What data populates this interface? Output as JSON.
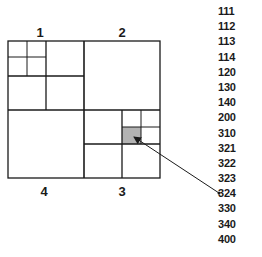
{
  "diagram": {
    "type": "quadtree",
    "quadrant_labels": {
      "q1": "1",
      "q2": "2",
      "q3": "3",
      "q4": "4"
    },
    "highlighted_cell": "323",
    "colors": {
      "line": "#1a1a1a",
      "highlight": "#b3b3b3",
      "background": "#ffffff"
    },
    "arrow": {
      "from": "code-324-row",
      "to": "cell-323"
    }
  },
  "code_list": [
    "111",
    "112",
    "113",
    "114",
    "120",
    "130",
    "140",
    "200",
    "310",
    "321",
    "322",
    "323",
    "324",
    "330",
    "340",
    "400"
  ]
}
